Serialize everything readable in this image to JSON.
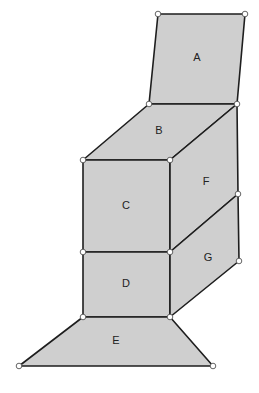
{
  "diagram": {
    "face_color": "#cfcfcf",
    "edge_color": "#1e1e1e",
    "faces": [
      {
        "id": "A",
        "label": "A"
      },
      {
        "id": "B",
        "label": "B"
      },
      {
        "id": "C",
        "label": "C"
      },
      {
        "id": "D",
        "label": "D"
      },
      {
        "id": "E",
        "label": "E"
      },
      {
        "id": "F",
        "label": "F"
      },
      {
        "id": "G",
        "label": "G"
      }
    ]
  }
}
